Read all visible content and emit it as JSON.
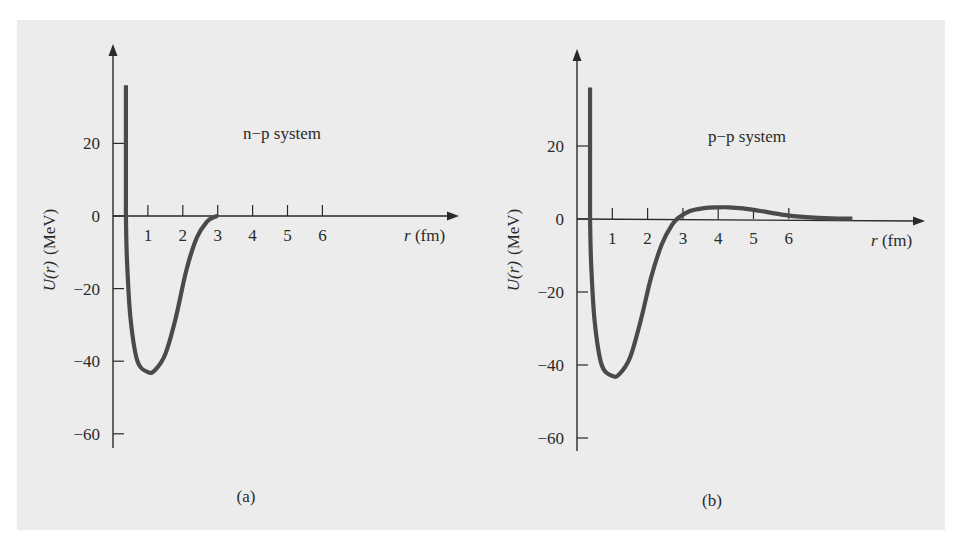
{
  "figure": {
    "background": "#ececec",
    "curve_color": "#4a4a4a",
    "axis_color": "#2a2a2a"
  },
  "chart_data": [
    {
      "id": "a",
      "type": "line",
      "panel_label": "(a)",
      "annotation": "n−p system",
      "xlabel_italic": "r",
      "xlabel_unit": " (fm)",
      "ylabel_italic": "U(r)",
      "ylabel_unit": "(MeV)",
      "x_ticks": [
        "1",
        "2",
        "3",
        "4",
        "5",
        "6"
      ],
      "y_ticks": [
        "20",
        "0",
        "−20",
        "−40",
        "−60"
      ],
      "ylim": [
        -64,
        48
      ],
      "xlim": [
        0,
        9.5
      ],
      "series": [
        {
          "name": "U(r) n-p",
          "x": [
            0.37,
            0.37,
            0.4,
            0.5,
            0.7,
            1.0,
            1.2,
            1.5,
            1.8,
            2.1,
            2.4,
            2.7,
            2.9,
            3.0
          ],
          "y": [
            36,
            0,
            -12,
            -28,
            -40,
            -43,
            -42.5,
            -38,
            -28,
            -15,
            -6,
            -1.5,
            -0.3,
            0
          ]
        },
        {
          "name": "U(r) n-p (beyond range)",
          "x": [
            3.0,
            6.0
          ],
          "y": [
            0,
            0
          ]
        }
      ]
    },
    {
      "id": "b",
      "type": "line",
      "panel_label": "(b)",
      "annotation": "p−p system",
      "xlabel_italic": "r",
      "xlabel_unit": " (fm)",
      "ylabel_italic": "U(r)",
      "ylabel_unit": "(MeV)",
      "x_ticks": [
        "1",
        "2",
        "3",
        "4",
        "5",
        "6"
      ],
      "y_ticks": [
        "20",
        "0",
        "−20",
        "−40",
        "−60"
      ],
      "ylim": [
        -64,
        48
      ],
      "xlim": [
        0,
        9.5
      ],
      "series": [
        {
          "name": "U(r) p-p",
          "x": [
            0.37,
            0.37,
            0.4,
            0.5,
            0.7,
            1.0,
            1.2,
            1.5,
            1.8,
            2.1,
            2.4,
            2.7,
            2.9,
            3.2,
            3.6,
            4.0,
            4.3,
            4.7,
            5.2,
            5.8,
            6.5,
            7.2,
            7.8
          ],
          "y": [
            36,
            0,
            -12,
            -28,
            -40,
            -43,
            -42.5,
            -38,
            -28,
            -16,
            -7,
            -1.5,
            0.5,
            2.2,
            3.0,
            3.2,
            3.2,
            2.9,
            2.2,
            1.2,
            0.5,
            0.15,
            0.1
          ]
        }
      ]
    }
  ]
}
